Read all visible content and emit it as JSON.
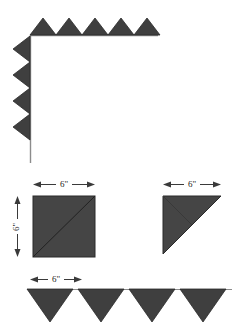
{
  "figure": {
    "colors": {
      "fill": "#3f3f3f",
      "fill_alt": "#454545",
      "stroke": "#2a2a2a",
      "line": "#8c8c8c",
      "dim_line": "#3a3a3a",
      "text": "#1c1c1c",
      "background": "#ffffff"
    },
    "panels": {
      "corner": {
        "name": "corner-assembly",
        "top_run": {
          "count": 5,
          "tooth_width": 26,
          "tooth_height": 17,
          "baseline_y": 35,
          "start_x": 30,
          "end_x": 158,
          "direction": "up"
        },
        "side_run": {
          "count": 4,
          "tooth_width": 17,
          "tooth_height": 26,
          "baseline_x": 30,
          "start_y": 35,
          "end_y": 163,
          "direction": "left"
        }
      },
      "square_unit": {
        "name": "square-unit",
        "label_top": "6\"",
        "label_left": "6\"",
        "diagonal": "bottom-left-to-top-right",
        "x": 33,
        "y": 196,
        "size": 62
      },
      "triangle_unit": {
        "name": "triangle-unit",
        "label_top": "6\"",
        "right_angle": "top-left",
        "x": 163,
        "y": 196,
        "size": 58
      },
      "bottom_run": {
        "name": "bottom-sawtooth-run",
        "label_top": "6\"",
        "count": 4,
        "tooth_width": 46,
        "tooth_height": 33,
        "baseline_y": 289,
        "start_x": 27,
        "end_x": 230,
        "direction": "down"
      }
    },
    "labels": {
      "square_top": "6\"",
      "square_left": "6\"",
      "triangle_top": "6\"",
      "bottom_run": "6\""
    }
  }
}
